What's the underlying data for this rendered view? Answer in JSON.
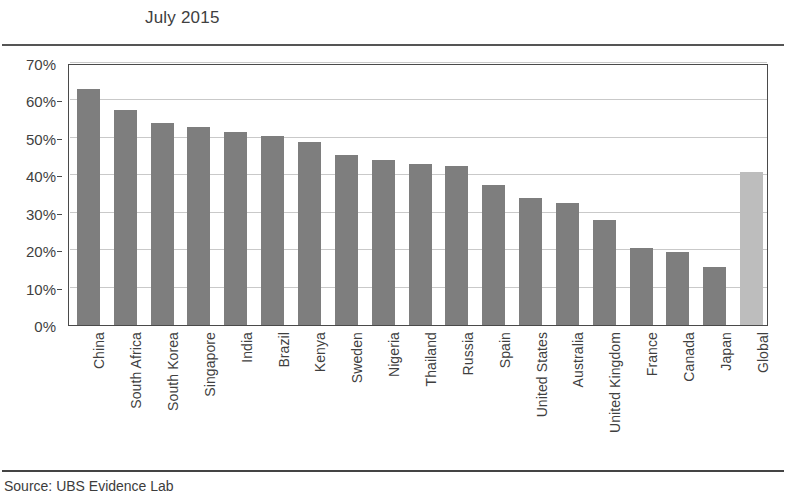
{
  "title": "July 2015",
  "source_note": "Source: UBS Evidence Lab",
  "colors": {
    "bar": "#7e7e7e",
    "bar_highlight": "#bdbdbd",
    "gridline": "#c9c9c9",
    "axis": "#4a4a4a",
    "rule": "#555555",
    "text": "#3f3f3f"
  },
  "chart_data": {
    "type": "bar",
    "title": "July 2015",
    "xlabel": "",
    "ylabel": "",
    "ylim": [
      0,
      70
    ],
    "ytick_values": [
      0,
      10,
      20,
      30,
      40,
      50,
      60,
      70
    ],
    "ytick_labels": [
      "0%",
      "10%",
      "20%",
      "30%",
      "40%",
      "50%",
      "60%",
      "70%"
    ],
    "grid": true,
    "legend": null,
    "units": "percent",
    "categories": [
      "China",
      "South Africa",
      "South Korea",
      "Singapore",
      "India",
      "Brazil",
      "Kenya",
      "Sweden",
      "Nigeria",
      "Thailand",
      "Russia",
      "Spain",
      "United States",
      "Australia",
      "United Kingdom",
      "France",
      "Canada",
      "Japan",
      "Global"
    ],
    "values": [
      63,
      57.5,
      54,
      53,
      51.5,
      50.5,
      49,
      45.5,
      44,
      43,
      42.5,
      37.5,
      34,
      32.5,
      28,
      20.5,
      19.5,
      15.5,
      41
    ],
    "highlight_categories": [
      "Global"
    ]
  }
}
